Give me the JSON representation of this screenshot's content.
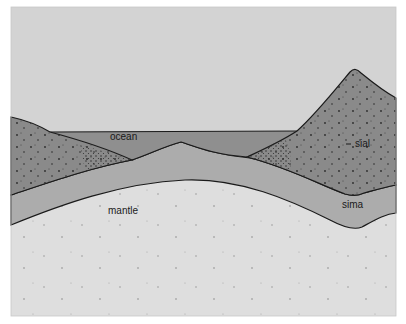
{
  "diagram": {
    "labels": {
      "ocean": "ocean",
      "sial": "sial",
      "sima": "sima",
      "mantle": "mantle"
    },
    "colors": {
      "sky": "#d3d3d3",
      "ocean": "#8f8f8f",
      "sial": "#8a8a8a",
      "sima": "#acacac",
      "mantle": "#dedede",
      "outline": "#1a1a1a"
    },
    "layers": [
      "ocean",
      "sial",
      "sima",
      "mantle"
    ]
  }
}
